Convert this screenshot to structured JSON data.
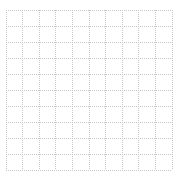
{
  "figure": {
    "background_color": "#ffffff",
    "width": 183,
    "height": 179
  },
  "chart_data": {
    "type": "line",
    "title": "",
    "subtitle": "",
    "xlabel": "",
    "ylabel": "",
    "series": [],
    "categories": [],
    "x": [],
    "values": [],
    "annotations": [],
    "legend": {
      "visible": false,
      "position": "none",
      "entries": []
    },
    "grid": {
      "visible": true,
      "style": "dotted",
      "color": "#c8c8c8",
      "line_width": 1,
      "x_major_count": 10,
      "y_major_count": 10,
      "x_gridline_positions": [
        6,
        22.6,
        39.2,
        55.8,
        72.4,
        89,
        105.6,
        122.2,
        138.8,
        155.4,
        172
      ],
      "y_gridline_positions": [
        10,
        26,
        42,
        58,
        74,
        90,
        106,
        122,
        138,
        154,
        170
      ]
    },
    "axes": {
      "x_tick_labels": [],
      "y_tick_labels": [],
      "xlim": [
        0,
        10
      ],
      "ylim": [
        0,
        10
      ],
      "spines_visible": false,
      "ticks_visible": false
    },
    "plot_area": {
      "left": 6,
      "top": 10,
      "right": 172,
      "bottom": 170,
      "face_color": "#ffffff"
    }
  },
  "colors": {
    "grid": "#c8c8c8",
    "grid_light": "#d9d9d9",
    "background": "#ffffff"
  }
}
